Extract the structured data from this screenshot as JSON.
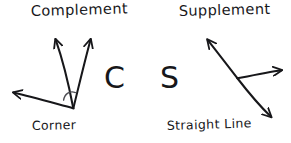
{
  "canvas": {
    "width": 291,
    "height": 143,
    "background_color": "#ffffff",
    "ink_color": "#17171a",
    "style": "hand-drawn whiteboard sketch"
  },
  "diagram": {
    "title_text": "",
    "left_group": {
      "name": "complement",
      "heading": "Complement",
      "vertex_label": "Corner",
      "mnemonic_letter": "C",
      "angle_degrees": 90,
      "angle_marker": "arc",
      "rays": [
        {
          "name": "complement-ray-left",
          "from": [
            73,
            108
          ],
          "to": [
            55,
            38
          ],
          "arrowhead": "end"
        },
        {
          "name": "complement-ray-right",
          "from": [
            73,
            108
          ],
          "to": [
            91,
            38
          ],
          "arrowhead": "end"
        },
        {
          "name": "corner-baseline-ray",
          "from": [
            73,
            108
          ],
          "to": [
            12,
            92
          ],
          "arrowhead": "end"
        }
      ]
    },
    "right_group": {
      "name": "supplement",
      "heading": "Supplement",
      "vertex_label": "Straight Line",
      "mnemonic_letter": "S",
      "angle_degrees": 180,
      "angle_marker": "none",
      "rays": [
        {
          "name": "supplement-ray-upper-left",
          "from": [
            237,
            78
          ],
          "to": [
            206,
            38
          ],
          "arrowhead": "end"
        },
        {
          "name": "supplement-ray-lower-right",
          "from": [
            237,
            78
          ],
          "to": [
            272,
            118
          ],
          "arrowhead": "end"
        },
        {
          "name": "supplement-ray-horizontal",
          "from": [
            237,
            78
          ],
          "to": [
            283,
            70
          ],
          "arrowhead": "end"
        }
      ]
    }
  },
  "labels": {
    "complement": "Complement",
    "corner": "Corner",
    "supplement": "Supplement",
    "straight_line": "Straight Line",
    "letter_c": "C",
    "letter_s": "S"
  }
}
